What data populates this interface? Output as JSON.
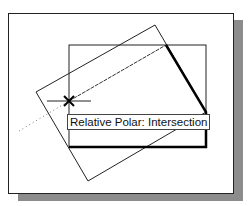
{
  "tooltip": {
    "text": "Relative Polar: Intersection"
  },
  "colors": {
    "shadow": "#8c8c8c",
    "line": "#222222",
    "bold_line": "#000000",
    "background": "#ffffff"
  },
  "diagram": {
    "outer_frame": {
      "x": 8,
      "y": 13,
      "width": 224,
      "height": 179
    },
    "reference_rect": {
      "x": 69,
      "y": 45,
      "width": 137,
      "height": 102
    },
    "rotated_rect_corners": [
      [
        36,
        92
      ],
      [
        155,
        25
      ],
      [
        206,
        112
      ],
      [
        88,
        181
      ]
    ],
    "bold_polyline": [
      [
        166,
        45
      ],
      [
        206,
        112
      ],
      [
        206,
        147
      ],
      [
        69,
        147
      ]
    ],
    "polar_tracking_line": {
      "from": [
        19,
        131
      ],
      "to": [
        166,
        45
      ]
    },
    "crosshair": {
      "x": 69,
      "y": 101,
      "arm": 22
    }
  }
}
